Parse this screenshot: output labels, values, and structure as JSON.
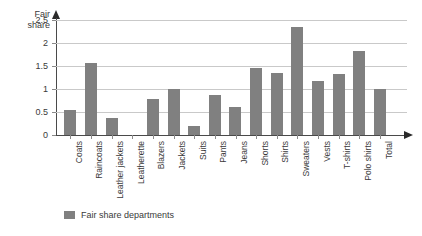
{
  "chart_data": {
    "type": "bar",
    "title": "",
    "subtitle": "",
    "xlabel": "",
    "ylabel": "Fair\nshare",
    "ylim": [
      0,
      2.5
    ],
    "ytick_values": [
      0,
      0.5,
      1,
      1.5,
      2,
      2.5
    ],
    "ytick_labels": [
      "0",
      "0.5",
      "1",
      "1.5",
      "2",
      "2.5"
    ],
    "grid": true,
    "legend_position": "bottom-left",
    "categories": [
      "Coats",
      "Raincoats",
      "Leather jackets",
      "Leatherette",
      "Blazers",
      "Jackets",
      "Suits",
      "Pants",
      "Jeans",
      "Shorts",
      "Shirts",
      "Sweaters",
      "Vests",
      "T-shirts",
      "Polo shirts",
      "Total"
    ],
    "series": [
      {
        "name": "Fair share departments",
        "color": "#808080",
        "values": [
          0.55,
          1.57,
          0.38,
          0,
          0.78,
          1.0,
          0.2,
          0.87,
          0.6,
          1.45,
          1.35,
          2.35,
          1.18,
          1.33,
          1.83,
          1.0
        ]
      }
    ],
    "legend": [
      "Fair share departments"
    ],
    "annotations": []
  },
  "legend": {
    "label": "Fair share departments",
    "swatch_color": "#808080"
  },
  "axes": {
    "y_title": "Fair\nshare",
    "arrow_x": "x-axis-arrow",
    "arrow_y": "y-axis-arrow"
  }
}
